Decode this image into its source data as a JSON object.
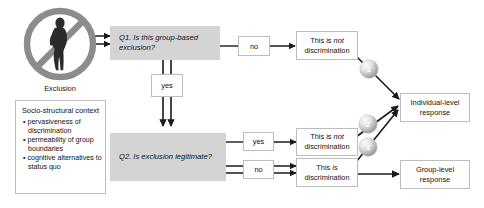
{
  "diagram": {
    "source_icon": {
      "name": "exclusion-prohibition-icon",
      "label": "Exclusion",
      "circle_color": "#8c8c8c",
      "figure_color": "#2b2b2b"
    },
    "context_box": {
      "title": "Socio-structural context",
      "items": [
        "pervasiveness of discrimination",
        "permeability of group boundaries",
        "cognitive alternatives to status quo"
      ]
    },
    "questions": [
      {
        "id": "q1",
        "label": "Q1. Is this group-based exclusion?",
        "fill": "#d4d4d4"
      },
      {
        "id": "q2",
        "label": "Q2. Is exclusion legitimate?",
        "fill": "#d4d4d4"
      }
    ],
    "branch_labels": {
      "q1_no": "no",
      "q1_yes": "yes",
      "q2_yes": "yes",
      "q2_no": "no"
    },
    "outcomes": [
      {
        "id": "out-top",
        "prefix": "This is ",
        "emphasis": "not",
        "suffix": "",
        "second_line": "discrimination"
      },
      {
        "id": "out-mid",
        "prefix": "This is ",
        "emphasis": "not",
        "suffix": "",
        "second_line": "discrimination"
      },
      {
        "id": "out-bottom",
        "prefix": "This ",
        "emphasis": "is",
        "suffix": "",
        "second_line": "discrimination"
      }
    ],
    "responses": [
      {
        "id": "resp-individual",
        "line1": "Individual-level",
        "line2": "response"
      },
      {
        "id": "resp-group",
        "line1": "Group-level",
        "line2": "response"
      }
    ],
    "spheres": [
      {
        "id": "sphere-1",
        "label": "1"
      },
      {
        "id": "sphere-2",
        "label": "2"
      },
      {
        "id": "sphere-3",
        "label": "3"
      }
    ],
    "colors": {
      "question_fill": "#d4d4d4",
      "box_border": "#bdbdbd",
      "arrow": "#1a1a1a",
      "sphere_light": "#f2f2f2",
      "sphere_dark": "#9a9a9a",
      "text": "#111111"
    }
  }
}
